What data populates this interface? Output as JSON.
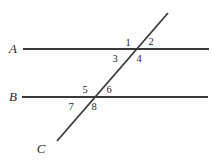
{
  "canvas": {
    "width": 213,
    "height": 162,
    "background": "#ffffff"
  },
  "style": {
    "stroke_color": "#3a3a3a",
    "text_color": "#2a2a2a",
    "line_width": 1.8,
    "transversal_width": 1.8
  },
  "figure": {
    "line_labels": [
      {
        "name": "line-a",
        "text": "A",
        "x": 13,
        "y": 53
      },
      {
        "name": "line-b",
        "text": "B",
        "x": 13,
        "y": 101
      },
      {
        "name": "line-c",
        "text": "C",
        "x": 41,
        "y": 153
      }
    ],
    "lines": [
      {
        "name": "line-a-segment",
        "label": "A",
        "x1": 23,
        "y1": 49,
        "x2": 209,
        "y2": 49
      },
      {
        "name": "line-b-segment",
        "label": "B",
        "x1": 22,
        "y1": 97,
        "x2": 208,
        "y2": 97
      },
      {
        "name": "transversal-c-segment",
        "label": "C",
        "x1": 168,
        "y1": 13,
        "x2": 57,
        "y2": 141
      }
    ],
    "intersections": [
      {
        "name": "intersection-a",
        "x": 136,
        "y": 49
      },
      {
        "name": "intersection-b",
        "x": 93,
        "y": 97
      }
    ],
    "angle_labels": [
      {
        "name": "angle-label-1",
        "text": "1",
        "x": 128,
        "y": 46
      },
      {
        "name": "angle-label-2",
        "text": "2",
        "x": 151,
        "y": 45
      },
      {
        "name": "angle-label-3",
        "text": "3",
        "x": 115,
        "y": 62
      },
      {
        "name": "angle-label-4",
        "text": "4",
        "x": 139,
        "y": 62
      },
      {
        "name": "angle-label-5",
        "text": "5",
        "x": 85,
        "y": 93
      },
      {
        "name": "angle-label-6",
        "text": "6",
        "x": 109,
        "y": 93
      },
      {
        "name": "angle-label-7",
        "text": "7",
        "x": 71,
        "y": 110
      },
      {
        "name": "angle-label-8",
        "text": "8",
        "x": 94,
        "y": 110
      }
    ]
  }
}
